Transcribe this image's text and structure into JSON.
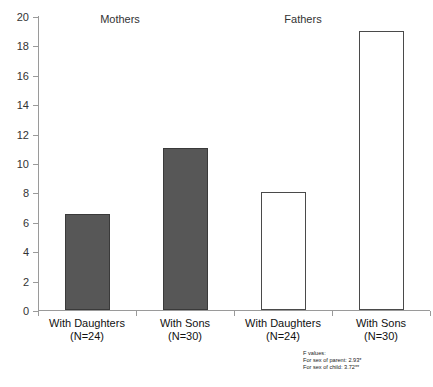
{
  "chart_data": {
    "type": "bar",
    "title": "",
    "subtitle": "",
    "xlabel": "",
    "ylabel": "",
    "ylim": [
      0,
      20
    ],
    "yticks": [
      0,
      2,
      4,
      6,
      8,
      10,
      12,
      14,
      16,
      18,
      20
    ],
    "ytick_labels": [
      "0",
      "2",
      "4",
      "6",
      "8",
      "10",
      "12",
      "14",
      "16",
      "18",
      "20"
    ],
    "grid": false,
    "legend": null,
    "categories": [
      "With Daughters\n(N=24)",
      "With Sons\n(N=30)",
      "With Daughters\n(N=24)",
      "With Sons\n(N=30)"
    ],
    "values": [
      6.5,
      11.0,
      8.0,
      19.0
    ],
    "bar_styles": [
      "filled",
      "filled",
      "hollow",
      "hollow"
    ],
    "group_titles": [
      "Mothers",
      "Fathers"
    ],
    "annotations": [
      "F values:",
      "For sex of parent: 2.93*",
      "For sex of child: 3.72**"
    ],
    "colors": {
      "filled_bar": "#575757",
      "filled_bar_border": "#3a3a3a",
      "hollow_bar": "#ffffff",
      "hollow_bar_border": "#4a4a4a",
      "axis": "#9a9a9a",
      "text": "#333333",
      "background": "#ffffff"
    }
  },
  "groups": [
    {
      "label": "Mothers"
    },
    {
      "label": "Fathers"
    }
  ],
  "bars": [
    {
      "value": 6.5,
      "label_line1": "With Daughters",
      "label_line2": "(N=24)",
      "style": "filled"
    },
    {
      "value": 11.0,
      "label_line1": "With Sons",
      "label_line2": "(N=30)",
      "style": "filled"
    },
    {
      "value": 8.0,
      "label_line1": "With Daughters",
      "label_line2": "(N=24)",
      "style": "hollow"
    },
    {
      "value": 19.0,
      "label_line1": "With Sons",
      "label_line2": "(N=30)",
      "style": "hollow"
    }
  ],
  "yaxis": {
    "ticks": [
      "20",
      "18",
      "16",
      "14",
      "12",
      "10",
      "8",
      "6",
      "4",
      "2",
      "0"
    ]
  },
  "footnote": {
    "line1": "F values:",
    "line2": "For sex of parent: 2.93*",
    "line3": "For sex of child: 3.72**"
  }
}
